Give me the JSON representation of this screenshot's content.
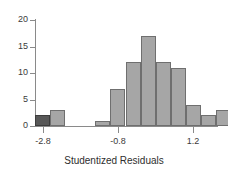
{
  "chart_data": {
    "type": "bar",
    "title": "",
    "xlabel": "Studentized Residuals",
    "ylabel": "",
    "xlim": [
      -3.0,
      1.8
    ],
    "ylim": [
      0,
      20
    ],
    "grid": false,
    "legend": "none",
    "bin_width": 0.4,
    "x_ticks": [
      {
        "value": -2.8,
        "label": "-2.8"
      },
      {
        "value": -0.8,
        "label": "-0.8"
      },
      {
        "value": 1.2,
        "label": "1.2"
      }
    ],
    "y_ticks": [
      {
        "value": 0,
        "label": "0"
      },
      {
        "value": 5,
        "label": "5"
      },
      {
        "value": 10,
        "label": "10"
      },
      {
        "value": 15,
        "label": "15"
      },
      {
        "value": 20,
        "label": "20"
      }
    ],
    "bins": [
      {
        "x0": -3.0,
        "x1": -2.6,
        "count": 2,
        "highlight": true
      },
      {
        "x0": -2.6,
        "x1": -2.2,
        "count": 3,
        "highlight": false
      },
      {
        "x0": -2.2,
        "x1": -1.8,
        "count": 0,
        "highlight": false
      },
      {
        "x0": -1.8,
        "x1": -1.4,
        "count": 0,
        "highlight": false
      },
      {
        "x0": -1.4,
        "x1": -1.0,
        "count": 1,
        "highlight": false
      },
      {
        "x0": -1.0,
        "x1": -0.6,
        "count": 7,
        "highlight": false
      },
      {
        "x0": -0.6,
        "x1": -0.2,
        "count": 12,
        "highlight": false
      },
      {
        "x0": -0.2,
        "x1": 0.2,
        "count": 17,
        "highlight": false
      },
      {
        "x0": 0.2,
        "x1": 0.6,
        "count": 12,
        "highlight": false
      },
      {
        "x0": 0.6,
        "x1": 1.0,
        "count": 11,
        "highlight": false
      },
      {
        "x0": 1.0,
        "x1": 1.4,
        "count": 4,
        "highlight": false
      },
      {
        "x0": 1.4,
        "x1": 1.8,
        "count": 2,
        "highlight": false
      },
      {
        "x0": 1.8,
        "x1": 2.2,
        "count": 3,
        "highlight": false
      },
      {
        "x0": 2.2,
        "x1": 2.6,
        "count": 1,
        "highlight": false
      },
      {
        "x0": 2.6,
        "x1": 3.0,
        "count": 2,
        "highlight": false
      }
    ],
    "categories": [
      "-3.0 to -2.6",
      "-2.6 to -2.2",
      "-2.2 to -1.8",
      "-1.8 to -1.4",
      "-1.4 to -1.0",
      "-1.0 to -0.6",
      "-0.6 to -0.2",
      "-0.2 to 0.2",
      "0.2 to 0.6",
      "0.6 to 1.0",
      "1.0 to 1.4",
      "1.4 to 1.8",
      "1.8 to 2.2",
      "2.2 to 2.6",
      "2.6 to 3.0"
    ],
    "values": [
      2,
      3,
      0,
      0,
      1,
      7,
      12,
      17,
      12,
      11,
      4,
      2,
      3,
      1,
      2
    ],
    "colors": {
      "bar_fill": "#a6a6a6",
      "bar_stroke": "#6f6f6f",
      "highlight_fill": "#585858",
      "highlight_stroke": "#3d3d3d",
      "axis": "#8a8a8a",
      "text": "#2e2e2e",
      "background": "#ffffff"
    }
  }
}
